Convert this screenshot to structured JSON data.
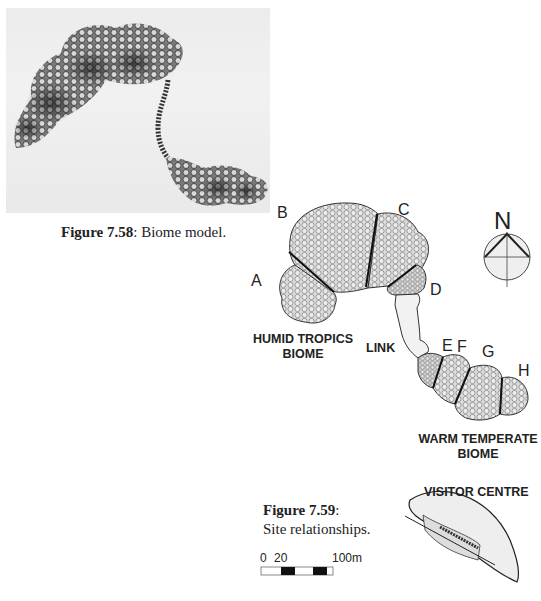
{
  "figure_58": {
    "caption_number": "Figure 7.58",
    "caption_text": ": Biome model."
  },
  "figure_59": {
    "caption_number": "Figure 7.59",
    "caption_colon": ":",
    "caption_text": "Site relationships."
  },
  "map": {
    "domes": [
      "A",
      "B",
      "C",
      "D",
      "E",
      "F",
      "G",
      "H"
    ],
    "labels": {
      "A": "A",
      "B": "B",
      "C": "C",
      "D": "D",
      "E": "E",
      "F": "F",
      "G": "G",
      "H": "H"
    },
    "humid_tropics_line1": "HUMID TROPICS",
    "humid_tropics_line2": "BIOME",
    "link": "LINK",
    "warm_temperate_line1": "WARM TEMPERATE",
    "warm_temperate_line2": "BIOME",
    "visitor_centre": "VISITOR CENTRE",
    "north": "N"
  },
  "scale_bar": {
    "start": "0",
    "mid": "20",
    "end": "100m"
  },
  "colors": {
    "dome_fill": "#d6d6d6",
    "outline": "#333333",
    "link_fill": "#f0f0f0"
  }
}
